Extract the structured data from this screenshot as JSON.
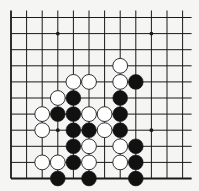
{
  "diagram": {
    "type": "go-board-fragment",
    "background": "#f5f5f3",
    "line_color": "#1a1a1a",
    "black_stone_color": "#111111",
    "white_stone_color": "#ffffff",
    "columns": 12,
    "rows": 11,
    "open_edges": [
      "top",
      "right"
    ],
    "border_edges": [
      "left",
      "bottom"
    ],
    "star_points": [
      {
        "col": 3,
        "row": 1
      },
      {
        "col": 9,
        "row": 1
      },
      {
        "col": 3,
        "row": 7
      },
      {
        "col": 9,
        "row": 7
      }
    ],
    "stones": [
      {
        "col": 7,
        "row": 3,
        "color": "white"
      },
      {
        "col": 4,
        "row": 4,
        "color": "white"
      },
      {
        "col": 5,
        "row": 4,
        "color": "white"
      },
      {
        "col": 7,
        "row": 4,
        "color": "white"
      },
      {
        "col": 8,
        "row": 4,
        "color": "black"
      },
      {
        "col": 3,
        "row": 5,
        "color": "white"
      },
      {
        "col": 4,
        "row": 5,
        "color": "black"
      },
      {
        "col": 7,
        "row": 5,
        "color": "black"
      },
      {
        "col": 2,
        "row": 6,
        "color": "white"
      },
      {
        "col": 3,
        "row": 6,
        "color": "black"
      },
      {
        "col": 4,
        "row": 6,
        "color": "black"
      },
      {
        "col": 5,
        "row": 6,
        "color": "white"
      },
      {
        "col": 6,
        "row": 6,
        "color": "white"
      },
      {
        "col": 7,
        "row": 6,
        "color": "black"
      },
      {
        "col": 2,
        "row": 7,
        "color": "white"
      },
      {
        "col": 4,
        "row": 7,
        "color": "black"
      },
      {
        "col": 5,
        "row": 7,
        "color": "black"
      },
      {
        "col": 6,
        "row": 7,
        "color": "white"
      },
      {
        "col": 7,
        "row": 7,
        "color": "black"
      },
      {
        "col": 4,
        "row": 8,
        "color": "black"
      },
      {
        "col": 5,
        "row": 8,
        "color": "white"
      },
      {
        "col": 7,
        "row": 8,
        "color": "white"
      },
      {
        "col": 8,
        "row": 8,
        "color": "black"
      },
      {
        "col": 2,
        "row": 9,
        "color": "white"
      },
      {
        "col": 3,
        "row": 9,
        "color": "white"
      },
      {
        "col": 4,
        "row": 9,
        "color": "black"
      },
      {
        "col": 5,
        "row": 9,
        "color": "white"
      },
      {
        "col": 7,
        "row": 9,
        "color": "white"
      },
      {
        "col": 8,
        "row": 9,
        "color": "black"
      },
      {
        "col": 3,
        "row": 10,
        "color": "black"
      },
      {
        "col": 5,
        "row": 10,
        "color": "black"
      },
      {
        "col": 8,
        "row": 10,
        "color": "black"
      }
    ]
  }
}
